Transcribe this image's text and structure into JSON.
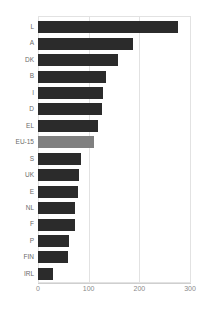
{
  "chart_data": {
    "type": "bar",
    "orientation": "horizontal",
    "title": "",
    "xlabel": "",
    "ylabel": "",
    "xlim": [
      0,
      300
    ],
    "xticks": [
      0,
      100,
      200,
      300
    ],
    "xtick_labels": [
      "0",
      "100",
      "200",
      "300"
    ],
    "grid": true,
    "grid_axis": "x",
    "legend": "none",
    "bar_color": "#2b2b2b",
    "highlight_color": "#808080",
    "highlight_category": "EU-15",
    "categories": [
      "L",
      "A",
      "DK",
      "B",
      "I",
      "D",
      "EL",
      "EU-15",
      "S",
      "UK",
      "E",
      "NL",
      "F",
      "P",
      "FIN",
      "IRL"
    ],
    "values": [
      276,
      187,
      157,
      135,
      129,
      127,
      119,
      111,
      84,
      81,
      78,
      74,
      73,
      62,
      60,
      30
    ],
    "bars": [
      {
        "category": "L",
        "value": 276,
        "highlight": false
      },
      {
        "category": "A",
        "value": 187,
        "highlight": false
      },
      {
        "category": "DK",
        "value": 157,
        "highlight": false
      },
      {
        "category": "B",
        "value": 135,
        "highlight": false
      },
      {
        "category": "I",
        "value": 129,
        "highlight": false
      },
      {
        "category": "D",
        "value": 127,
        "highlight": false
      },
      {
        "category": "EL",
        "value": 119,
        "highlight": false
      },
      {
        "category": "EU-15",
        "value": 111,
        "highlight": true
      },
      {
        "category": "S",
        "value": 84,
        "highlight": false
      },
      {
        "category": "UK",
        "value": 81,
        "highlight": false
      },
      {
        "category": "E",
        "value": 78,
        "highlight": false
      },
      {
        "category": "NL",
        "value": 74,
        "highlight": false
      },
      {
        "category": "F",
        "value": 73,
        "highlight": false
      },
      {
        "category": "P",
        "value": 62,
        "highlight": false
      },
      {
        "category": "FIN",
        "value": 60,
        "highlight": false
      },
      {
        "category": "IRL",
        "value": 30,
        "highlight": false
      }
    ]
  }
}
